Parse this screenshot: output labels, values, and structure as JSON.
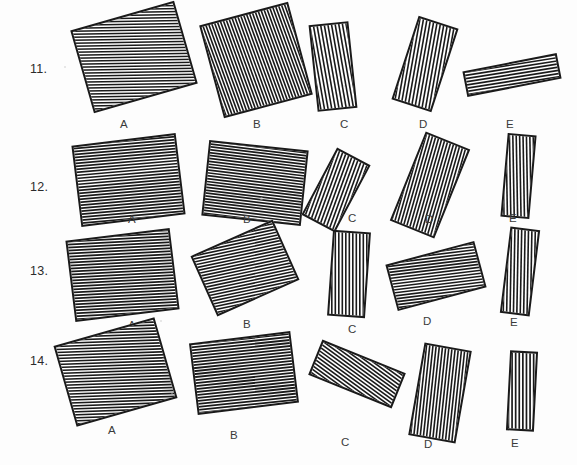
{
  "page": {
    "background_color": "#fdfdfd",
    "ink_color": "#1a1a1a",
    "width": 577,
    "height": 465
  },
  "rows": [
    {
      "number": "11.",
      "number_x": 30,
      "number_y": 62,
      "items": [
        {
          "label": "A",
          "label_x": 120,
          "label_y": 118,
          "x": 80,
          "y": 14,
          "w": 108,
          "h": 86,
          "rotate": -16,
          "hatch_angle": 75,
          "hatch_spacing": 3.0,
          "hatch_weight": 1.5
        },
        {
          "label": "B",
          "label_x": 253,
          "label_y": 118,
          "x": 210,
          "y": 12,
          "w": 92,
          "h": 96,
          "rotate": -15,
          "hatch_angle": 5,
          "hatch_spacing": 3.0,
          "hatch_weight": 1.6
        },
        {
          "label": "C",
          "label_x": 340,
          "label_y": 118,
          "x": 313,
          "y": 23,
          "w": 40,
          "h": 87,
          "rotate": -6,
          "hatch_angle": 4,
          "hatch_spacing": 3.6,
          "hatch_weight": 1.6
        },
        {
          "label": "D",
          "label_x": 419,
          "label_y": 118,
          "x": 404,
          "y": 20,
          "w": 42,
          "h": 88,
          "rotate": 18,
          "hatch_angle": 8,
          "hatch_spacing": 3.5,
          "hatch_weight": 1.6
        },
        {
          "label": "E",
          "label_x": 506,
          "label_y": 118,
          "x": 464,
          "y": 62,
          "w": 96,
          "h": 26,
          "rotate": -11,
          "hatch_angle": 88,
          "hatch_spacing": 3.2,
          "hatch_weight": 1.6
        }
      ]
    },
    {
      "number": "12.",
      "number_x": 30,
      "number_y": 180,
      "items": [
        {
          "label": "A",
          "label_x": 128,
          "label_y": 213,
          "x": 76,
          "y": 139,
          "w": 105,
          "h": 82,
          "rotate": -7,
          "hatch_angle": 88,
          "hatch_spacing": 3.0,
          "hatch_weight": 1.7
        },
        {
          "label": "B",
          "label_x": 243,
          "label_y": 213,
          "x": 205,
          "y": 145,
          "w": 100,
          "h": 76,
          "rotate": 6,
          "hatch_angle": 89,
          "hatch_spacing": 2.9,
          "hatch_weight": 1.7
        },
        {
          "label": "C",
          "label_x": 348,
          "label_y": 212,
          "x": 317,
          "y": 152,
          "w": 38,
          "h": 76,
          "rotate": 28,
          "hatch_angle": 8,
          "hatch_spacing": 3.4,
          "hatch_weight": 1.6
        },
        {
          "label": "D",
          "label_x": 425,
          "label_y": 213,
          "x": 406,
          "y": 137,
          "w": 48,
          "h": 96,
          "rotate": 22,
          "hatch_angle": 6,
          "hatch_spacing": 3.2,
          "hatch_weight": 1.6
        },
        {
          "label": "E",
          "label_x": 509,
          "label_y": 212,
          "x": 504,
          "y": 134,
          "w": 29,
          "h": 84,
          "rotate": 5,
          "hatch_angle": 6,
          "hatch_spacing": 3.4,
          "hatch_weight": 1.6
        }
      ]
    },
    {
      "number": "13.",
      "number_x": 30,
      "number_y": 264,
      "items": [
        {
          "label": "A",
          "label_x": 128,
          "label_y": 319,
          "x": 70,
          "y": 234,
          "w": 105,
          "h": 82,
          "rotate": -7,
          "hatch_angle": 86,
          "hatch_spacing": 3.0,
          "hatch_weight": 1.7
        },
        {
          "label": "B",
          "label_x": 243,
          "label_y": 318,
          "x": 200,
          "y": 235,
          "w": 90,
          "h": 66,
          "rotate": -24,
          "hatch_angle": 78,
          "hatch_spacing": 3.0,
          "hatch_weight": 1.6
        },
        {
          "label": "C",
          "label_x": 348,
          "label_y": 323,
          "x": 330,
          "y": 231,
          "w": 38,
          "h": 86,
          "rotate": 4,
          "hatch_angle": 4,
          "hatch_spacing": 3.5,
          "hatch_weight": 1.6
        },
        {
          "label": "D",
          "label_x": 423,
          "label_y": 315,
          "x": 390,
          "y": 252,
          "w": 92,
          "h": 48,
          "rotate": -15,
          "hatch_angle": 82,
          "hatch_spacing": 3.0,
          "hatch_weight": 1.6
        },
        {
          "label": "E",
          "label_x": 510,
          "label_y": 316,
          "x": 505,
          "y": 228,
          "w": 30,
          "h": 87,
          "rotate": 7,
          "hatch_angle": 6,
          "hatch_spacing": 3.4,
          "hatch_weight": 1.6
        }
      ]
    },
    {
      "number": "14.",
      "number_x": 30,
      "number_y": 354,
      "items": [
        {
          "label": "A",
          "label_x": 108,
          "label_y": 424,
          "x": 63,
          "y": 330,
          "w": 105,
          "h": 84,
          "rotate": -16,
          "hatch_angle": 76,
          "hatch_spacing": 3.0,
          "hatch_weight": 1.6
        },
        {
          "label": "B",
          "label_x": 230,
          "label_y": 429,
          "x": 193,
          "y": 337,
          "w": 102,
          "h": 72,
          "rotate": -7,
          "hatch_angle": 89,
          "hatch_spacing": 3.0,
          "hatch_weight": 1.8
        },
        {
          "label": "C",
          "label_x": 341,
          "label_y": 436,
          "x": 312,
          "y": 355,
          "w": 90,
          "h": 38,
          "rotate": 22,
          "hatch_angle": 76,
          "hatch_spacing": 3.2,
          "hatch_weight": 1.6
        },
        {
          "label": "D",
          "label_x": 424,
          "label_y": 438,
          "x": 416,
          "y": 346,
          "w": 48,
          "h": 94,
          "rotate": 10,
          "hatch_angle": 4,
          "hatch_spacing": 3.2,
          "hatch_weight": 1.6
        },
        {
          "label": "E",
          "label_x": 511,
          "label_y": 437,
          "x": 508,
          "y": 351,
          "w": 28,
          "h": 80,
          "rotate": 3,
          "hatch_angle": 3,
          "hatch_spacing": 3.6,
          "hatch_weight": 1.7
        }
      ]
    }
  ],
  "specks": [
    {
      "x": 64,
      "y": 66,
      "d": 2
    },
    {
      "x": 162,
      "y": 358,
      "d": 2
    },
    {
      "x": 171,
      "y": 392,
      "d": 2
    },
    {
      "x": 260,
      "y": 197,
      "d": 3
    },
    {
      "x": 343,
      "y": 85,
      "d": 2
    },
    {
      "x": 423,
      "y": 319,
      "d": 2
    },
    {
      "x": 160,
      "y": 320,
      "d": 2
    }
  ]
}
